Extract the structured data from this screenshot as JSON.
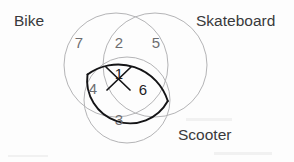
{
  "figure": {
    "type": "venn-diagram",
    "set_count": 3,
    "sets": [
      {
        "id": "bike",
        "label": "Bike",
        "label_x": 14,
        "label_y": 26,
        "cx": 116,
        "cy": 65,
        "r": 52
      },
      {
        "id": "skateboard",
        "label": "Skateboard",
        "label_x": 196,
        "label_y": 26,
        "cx": 155,
        "cy": 65,
        "r": 52
      },
      {
        "id": "scooter",
        "label": "Scooter",
        "label_x": 178,
        "label_y": 140,
        "cx": 127,
        "cy": 100,
        "r": 43
      }
    ],
    "regions": [
      {
        "id": "bike-only",
        "value": "7",
        "x": 79,
        "y": 48,
        "emphasis": "normal",
        "struck": false
      },
      {
        "id": "bike-skateboard",
        "value": "2",
        "x": 119,
        "y": 48,
        "emphasis": "normal",
        "struck": false
      },
      {
        "id": "skateboard-only",
        "value": "5",
        "x": 156,
        "y": 48,
        "emphasis": "normal",
        "struck": false
      },
      {
        "id": "bike-scooter",
        "value": "4",
        "x": 93,
        "y": 94,
        "emphasis": "normal",
        "struck": false
      },
      {
        "id": "bike-skateboard-scooter",
        "value": "1",
        "x": 119,
        "y": 79,
        "emphasis": "strong",
        "struck": true
      },
      {
        "id": "skateboard-scooter",
        "value": "6",
        "x": 143,
        "y": 95,
        "emphasis": "strong",
        "struck": false
      },
      {
        "id": "scooter-only",
        "value": "3",
        "x": 119,
        "y": 125,
        "emphasis": "normal",
        "struck": false
      }
    ],
    "highlight": {
      "id": "skateboard-scooter-lens",
      "description": "skateboard-scooter-overlap-outlined",
      "color": "#141416"
    },
    "strikethrough": {
      "id": "center-value-crossout",
      "description": "x-mark-over-center-value",
      "color": "#141416"
    },
    "colors": {
      "circle_stroke": "#b4b4b6",
      "label_text": "#39393b",
      "count_text": "#6d6d70",
      "count_text_strong": "#1d1d1f",
      "background": "#fdfdfd"
    }
  }
}
